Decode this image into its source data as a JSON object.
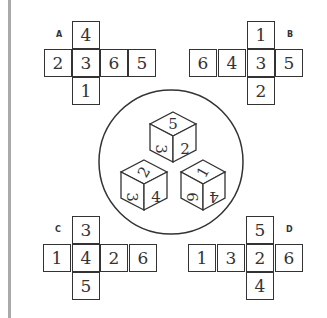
{
  "nets": [
    {
      "label": "A",
      "cells": [
        {
          "v": "4",
          "x": 72,
          "y": 21
        },
        {
          "v": "2",
          "x": 44,
          "y": 49
        },
        {
          "v": "3",
          "x": 72,
          "y": 49
        },
        {
          "v": "6",
          "x": 100,
          "y": 49
        },
        {
          "v": "5",
          "x": 128,
          "y": 49
        },
        {
          "v": "1",
          "x": 72,
          "y": 77
        }
      ],
      "lx": 56,
      "ly": 30
    },
    {
      "label": "B",
      "cells": [
        {
          "v": "1",
          "x": 247,
          "y": 21
        },
        {
          "v": "6",
          "x": 189,
          "y": 49
        },
        {
          "v": "4",
          "x": 218,
          "y": 49
        },
        {
          "v": "3",
          "x": 247,
          "y": 49
        },
        {
          "v": "5",
          "x": 275,
          "y": 49
        },
        {
          "v": "2",
          "x": 247,
          "y": 77
        }
      ],
      "lx": 287,
      "ly": 30
    },
    {
      "label": "C",
      "cells": [
        {
          "v": "3",
          "x": 72,
          "y": 216
        },
        {
          "v": "1",
          "x": 43,
          "y": 244
        },
        {
          "v": "4",
          "x": 72,
          "y": 244
        },
        {
          "v": "2",
          "x": 100,
          "y": 244
        },
        {
          "v": "6",
          "x": 129,
          "y": 244
        },
        {
          "v": "5",
          "x": 72,
          "y": 272
        }
      ],
      "lx": 55,
      "ly": 225
    },
    {
      "label": "D",
      "cells": [
        {
          "v": "5",
          "x": 246,
          "y": 216
        },
        {
          "v": "1",
          "x": 188,
          "y": 244
        },
        {
          "v": "3",
          "x": 217,
          "y": 244
        },
        {
          "v": "2",
          "x": 246,
          "y": 244
        },
        {
          "v": "6",
          "x": 275,
          "y": 244
        },
        {
          "v": "4",
          "x": 246,
          "y": 272
        }
      ],
      "lx": 286,
      "ly": 225
    }
  ],
  "dice": [
    {
      "top": "5",
      "left": "3",
      "right": "2"
    },
    {
      "top": "2",
      "left": "3",
      "right": "4"
    },
    {
      "top": "1",
      "left": "6",
      "right": "4"
    }
  ]
}
